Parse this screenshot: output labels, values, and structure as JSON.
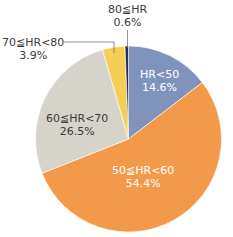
{
  "chart_data": {
    "type": "pie",
    "title": "",
    "categories": [
      "HR<50",
      "50≦HR<60",
      "60≦HR<70",
      "70≦HR<80",
      "80≦HR"
    ],
    "values": [
      14.6,
      54.4,
      26.5,
      3.9,
      0.6
    ],
    "unit": "%",
    "colors": [
      "#7f93bd",
      "#f39a4a",
      "#d6d3cb",
      "#f5cf55",
      "#2a2a55"
    ],
    "start_angle_deg": 0,
    "direction": "clockwise from 12 o'clock",
    "legend": "none (direct labels)"
  },
  "labels": {
    "hr_lt_50": {
      "name": "HR<50",
      "value": "14.6%"
    },
    "hr_50_60": {
      "name": "50≦HR<60",
      "value": "54.4%"
    },
    "hr_60_70": {
      "name": "60≦HR<70",
      "value": "26.5%"
    },
    "hr_70_80": {
      "name": "70≦HR<80",
      "value": "3.9%"
    },
    "hr_ge_80": {
      "name": "80≦HR",
      "value": "0.6%"
    }
  }
}
